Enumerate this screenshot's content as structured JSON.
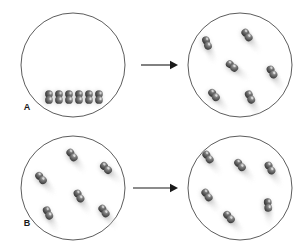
{
  "figure": {
    "title": "",
    "width": 305,
    "height": 246,
    "background_color": "#ffffff",
    "outline_color": "#4a4a4a",
    "molecule_color": "#6b6b6b",
    "molecule_dark_color": "#3f3f3f",
    "blur_color": "#c9c9c9",
    "arrow_color": "#1a1a1a"
  },
  "panels": [
    {
      "id": "A",
      "label": "A",
      "label_x": 27,
      "label_y": 110,
      "before": {
        "name": "flask-a-before",
        "cx": 73,
        "cy": 65,
        "r": 52,
        "state": "liquid",
        "molecule_count": 6,
        "molecules": [
          {
            "x": 49,
            "y": 97,
            "angle": 90,
            "blur": 0
          },
          {
            "x": 59,
            "y": 97,
            "angle": 90,
            "blur": 0
          },
          {
            "x": 69,
            "y": 97,
            "angle": 90,
            "blur": 0
          },
          {
            "x": 79,
            "y": 97,
            "angle": 90,
            "blur": 0
          },
          {
            "x": 89,
            "y": 97,
            "angle": 90,
            "blur": 0
          },
          {
            "x": 99,
            "y": 97,
            "angle": 90,
            "blur": 0
          }
        ]
      },
      "arrow": {
        "name": "arrow-a",
        "x1": 141,
        "x2": 178,
        "y": 65
      },
      "after": {
        "name": "flask-a-after",
        "cx": 240,
        "cy": 65,
        "r": 52,
        "state": "gas",
        "molecule_count": 6,
        "molecules": [
          {
            "x": 207,
            "y": 43,
            "angle": 70,
            "blur": 1
          },
          {
            "x": 247,
            "y": 35,
            "angle": 55,
            "blur": 1
          },
          {
            "x": 232,
            "y": 66,
            "angle": 40,
            "blur": 1
          },
          {
            "x": 272,
            "y": 72,
            "angle": 60,
            "blur": 1
          },
          {
            "x": 214,
            "y": 95,
            "angle": 50,
            "blur": 1
          },
          {
            "x": 250,
            "y": 97,
            "angle": 65,
            "blur": 1
          }
        ]
      }
    },
    {
      "id": "B",
      "label": "B",
      "label_x": 27,
      "label_y": 226,
      "before": {
        "name": "flask-b-before",
        "cx": 73,
        "cy": 188,
        "r": 52,
        "state": "gas",
        "molecule_count": 6,
        "molecules": [
          {
            "x": 72,
            "y": 155,
            "angle": 55,
            "blur": 1
          },
          {
            "x": 41,
            "y": 178,
            "angle": 50,
            "blur": 1
          },
          {
            "x": 106,
            "y": 168,
            "angle": 45,
            "blur": 1
          },
          {
            "x": 79,
            "y": 196,
            "angle": 60,
            "blur": 1
          },
          {
            "x": 48,
            "y": 213,
            "angle": 65,
            "blur": 1
          },
          {
            "x": 104,
            "y": 211,
            "angle": 55,
            "blur": 1
          }
        ]
      },
      "arrow": {
        "name": "arrow-b",
        "x1": 133,
        "x2": 178,
        "y": 188
      },
      "after": {
        "name": "flask-b-after",
        "cx": 240,
        "cy": 188,
        "r": 52,
        "state": "gas",
        "molecule_count": 6,
        "molecules": [
          {
            "x": 208,
            "y": 157,
            "angle": 55,
            "blur": 1
          },
          {
            "x": 240,
            "y": 165,
            "angle": 50,
            "blur": 1
          },
          {
            "x": 270,
            "y": 168,
            "angle": 60,
            "blur": 1
          },
          {
            "x": 207,
            "y": 195,
            "angle": 55,
            "blur": 1
          },
          {
            "x": 268,
            "y": 205,
            "angle": 85,
            "blur": 1
          },
          {
            "x": 229,
            "y": 217,
            "angle": 50,
            "blur": 1
          }
        ]
      }
    }
  ]
}
